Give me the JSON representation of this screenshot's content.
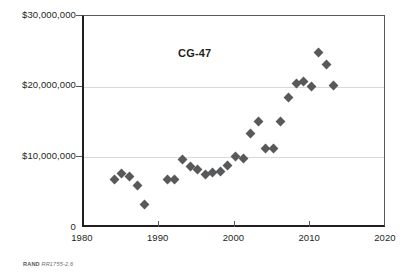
{
  "chart_data": {
    "type": "scatter",
    "title": "",
    "series_label": "CG-47",
    "xlabel": "",
    "ylabel": "",
    "xlim": [
      1980,
      2020
    ],
    "ylim": [
      0,
      30000000
    ],
    "x_ticks": [
      1980,
      1990,
      2000,
      2010,
      2020
    ],
    "x_tick_labels": [
      "1980",
      "1990",
      "2000",
      "2010",
      "2020"
    ],
    "y_ticks": [
      0,
      10000000,
      20000000,
      30000000
    ],
    "y_tick_labels": [
      "0",
      "$10,000,000",
      "$20,000,000",
      "$30,000,000"
    ],
    "grid": "horizontal",
    "legend": "none",
    "marker": "diamond",
    "marker_color": "#58595b",
    "x": [
      1984,
      1985,
      1986,
      1987,
      1988,
      1991,
      1992,
      1993,
      1994,
      1995,
      1996,
      1997,
      1998,
      1999,
      2000,
      2001,
      2002,
      2003,
      2004,
      2005,
      2006,
      2007,
      2008,
      2009,
      2010,
      2011,
      2012,
      2013
    ],
    "values": [
      6800000,
      7700000,
      7300000,
      6000000,
      3300000,
      6800000,
      6800000,
      9700000,
      8700000,
      8300000,
      7600000,
      7900000,
      8000000,
      8800000,
      10100000,
      9900000,
      13400000,
      15100000,
      11200000,
      11300000,
      15100000,
      18500000,
      20500000,
      20800000,
      20000000,
      24900000,
      23100000,
      20200000
    ]
  },
  "footer": {
    "source": "RAND",
    "document_id": "RR1755-2.6"
  }
}
